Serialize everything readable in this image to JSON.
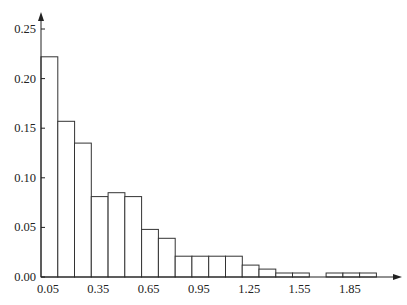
{
  "chart_data": {
    "type": "bar",
    "title": "",
    "xlabel": "",
    "ylabel": "",
    "bin_width": 0.1,
    "bin_start": 0.05,
    "bin_edges": [
      0.05,
      0.15,
      0.25,
      0.35,
      0.45,
      0.55,
      0.65,
      0.75,
      0.85,
      0.95,
      1.05,
      1.15,
      1.25,
      1.35,
      1.45,
      1.55,
      1.65,
      1.75,
      1.85,
      1.95,
      2.05
    ],
    "values": [
      0.222,
      0.157,
      0.135,
      0.081,
      0.085,
      0.081,
      0.048,
      0.039,
      0.021,
      0.021,
      0.021,
      0.021,
      0.012,
      0.008,
      0.004,
      0.004,
      0.0,
      0.004,
      0.004,
      0.004
    ],
    "x_ticks": [
      "0.05",
      "0.35",
      "0.65",
      "0.95",
      "1.25",
      "1.55",
      "1.85"
    ],
    "x_tick_values": [
      0.05,
      0.35,
      0.65,
      0.95,
      1.25,
      1.55,
      1.85
    ],
    "y_ticks": [
      "0.00",
      "0.05",
      "0.10",
      "0.15",
      "0.20",
      "0.25"
    ],
    "y_tick_values": [
      0,
      0.05,
      0.1,
      0.15,
      0.2,
      0.25
    ],
    "ylim": [
      0,
      0.25
    ],
    "xlim": [
      0.05,
      2.15
    ],
    "grid": false,
    "legend": null,
    "colors": {
      "bar_fill": "#ffffff",
      "bar_stroke": "#333333",
      "axis": "#222222"
    }
  }
}
